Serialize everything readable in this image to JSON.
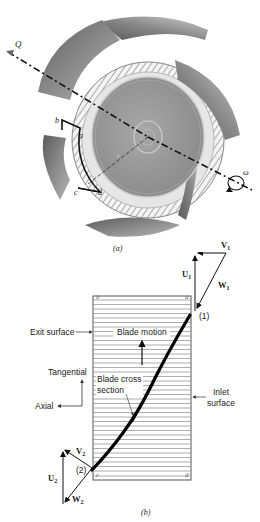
{
  "header": {
    "partial_text": ""
  },
  "figure_a": {
    "caption": "(a)",
    "flow_label": "Q",
    "rotation_label": "ω",
    "point_labels": {
      "a": "a",
      "b": "b",
      "c": "c",
      "d": "d",
      "r": "r"
    },
    "colors": {
      "blade": "#7a7a7a",
      "hub": "#9c9c9c",
      "hub_rim": "#c8c8c8",
      "axis": "#111111"
    }
  },
  "figure_b": {
    "caption": "(b)",
    "corner_labels": {
      "a": "a",
      "b": "b",
      "c": "c",
      "d": "d"
    },
    "labels": {
      "exit_surface": "Exit surface",
      "blade_motion": "Blade motion",
      "tangential": "Tangential",
      "axial": "Axial",
      "blade_cross_section_1": "Blade cross",
      "blade_cross_section_2": "section",
      "inlet_surface_1": "Inlet",
      "inlet_surface_2": "surface",
      "point_1": "(1)",
      "point_2": "(2)"
    },
    "vectors": {
      "V1": {
        "letter": "V",
        "sub": "1"
      },
      "U1": {
        "letter": "U",
        "sub": "1"
      },
      "W1": {
        "letter": "W",
        "sub": "1"
      },
      "V2": {
        "letter": "V",
        "sub": "2"
      },
      "U2": {
        "letter": "U",
        "sub": "2"
      },
      "W2": {
        "letter": "W",
        "sub": "2"
      }
    }
  }
}
